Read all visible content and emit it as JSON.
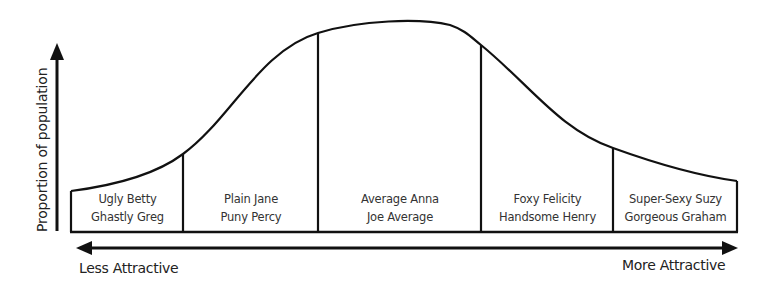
{
  "diagram": {
    "type": "bell-curve",
    "y_axis_label": "Proportion of population",
    "x_axis_left_label": "Less Attractive",
    "x_axis_right_label": "More Attractive",
    "segments": [
      {
        "line1": "Ugly Betty",
        "line2": "Ghastly Greg"
      },
      {
        "line1": "Plain Jane",
        "line2": "Puny Percy"
      },
      {
        "line1": "Average Anna",
        "line2": "Joe Average"
      },
      {
        "line1": "Foxy Felicity",
        "line2": "Handsome Henry"
      },
      {
        "line1": "Super-Sexy Suzy",
        "line2": "Gorgeous Graham"
      }
    ],
    "colors": {
      "stroke": "#111111",
      "text": "#333333",
      "background": "#ffffff"
    }
  }
}
